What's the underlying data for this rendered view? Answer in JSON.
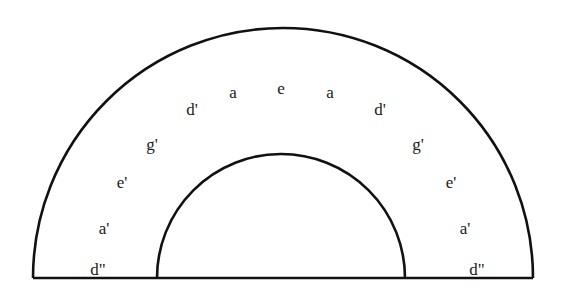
{
  "diagram": {
    "shape": "semicircular-annulus",
    "stroke_color": "#111111",
    "background": "#ffffff",
    "outer_arc": {
      "cx": 283,
      "cy": 278,
      "r": 250
    },
    "inner_arc": {
      "cx": 281,
      "cy": 278,
      "r": 124
    },
    "baseline_y": 278,
    "labels": [
      {
        "text": "d\"",
        "x": 98,
        "y": 275
      },
      {
        "text": "a'",
        "x": 104,
        "y": 234
      },
      {
        "text": "e'",
        "x": 122,
        "y": 188
      },
      {
        "text": "g'",
        "x": 152,
        "y": 150
      },
      {
        "text": "d'",
        "x": 192,
        "y": 115
      },
      {
        "text": "a",
        "x": 233,
        "y": 98
      },
      {
        "text": "e",
        "x": 281,
        "y": 94
      },
      {
        "text": "a",
        "x": 330,
        "y": 98
      },
      {
        "text": "d'",
        "x": 380,
        "y": 115
      },
      {
        "text": "g'",
        "x": 418,
        "y": 150
      },
      {
        "text": "e'",
        "x": 451,
        "y": 188
      },
      {
        "text": "a'",
        "x": 465,
        "y": 234
      },
      {
        "text": "d\"",
        "x": 477,
        "y": 275
      }
    ]
  }
}
